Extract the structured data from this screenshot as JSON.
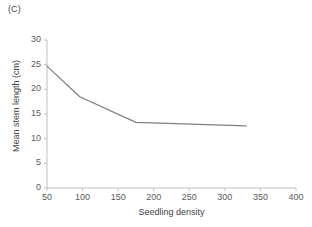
{
  "panel": {
    "label": "(C)"
  },
  "chart_data": {
    "type": "line",
    "title": "",
    "subtitle": "",
    "xlabel": "Seedling density",
    "ylabel": "Mean stem length (cm)",
    "xlim": [
      50,
      400
    ],
    "ylim": [
      0,
      30
    ],
    "xticks": [
      50,
      100,
      150,
      200,
      250,
      300,
      350,
      400
    ],
    "xtick_labels": [
      "50",
      "100",
      "150",
      "200",
      "250",
      "300",
      "350",
      "400"
    ],
    "yticks": [
      0,
      5,
      10,
      15,
      20,
      25,
      30
    ],
    "ytick_labels": [
      "0",
      "5",
      "10",
      "15",
      "20",
      "25",
      "30"
    ],
    "grid": false,
    "legend": false,
    "legend_position": "none",
    "line_color": "#7f7f7f",
    "line_width": 1.2,
    "markers": false,
    "series": [
      {
        "name": "Mean stem length",
        "x": [
          50,
          96,
          175,
          330
        ],
        "y": [
          24.7,
          18.5,
          13.3,
          12.6
        ]
      }
    ]
  }
}
